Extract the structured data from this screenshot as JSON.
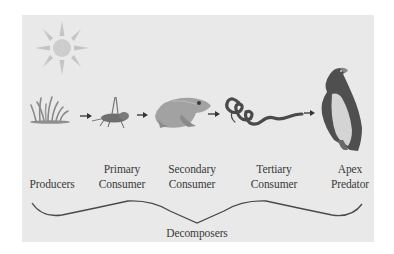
{
  "diagram": {
    "type": "food-chain",
    "background_color": "#e9e9e9",
    "sun": {
      "icon": "sun-icon"
    },
    "stages": [
      {
        "id": "producers",
        "icon": "grass-icon",
        "label_lines": [
          "",
          "Producers"
        ]
      },
      {
        "id": "primary",
        "icon": "grasshopper-icon",
        "label_lines": [
          "Primary",
          "Consumer"
        ]
      },
      {
        "id": "secondary",
        "icon": "frog-icon",
        "label_lines": [
          "Secondary",
          "Consumer"
        ]
      },
      {
        "id": "tertiary",
        "icon": "snake-icon",
        "label_lines": [
          "Tertiary",
          "Consumer"
        ]
      },
      {
        "id": "apex",
        "icon": "eagle-icon",
        "label_lines": [
          "Apex",
          "Predator"
        ]
      }
    ],
    "arrows": [
      "arrow-right-icon",
      "arrow-right-icon",
      "arrow-right-icon",
      "arrow-right-icon"
    ],
    "decomposers": {
      "label": "Decomposers",
      "brace": "curly-brace"
    }
  }
}
